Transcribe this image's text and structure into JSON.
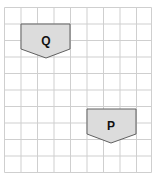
{
  "grid": {
    "x0": 4.5,
    "y0": 7.5,
    "cell": 16.5,
    "cols": 9,
    "rows": 10,
    "line_color": "#cfcfcf",
    "background": "#ffffff"
  },
  "shapes": [
    {
      "id": "Q",
      "label": "Q",
      "points": "21,24 70,24 70,49 46,58 21,49",
      "label_x": 46,
      "label_y": 45,
      "fill": "#dcdcdc",
      "stroke": "#606060"
    },
    {
      "id": "P",
      "label": "P",
      "points": "87,109 136,109 136,134 111,143 87,134",
      "label_x": 111,
      "label_y": 130,
      "fill": "#dcdcdc",
      "stroke": "#606060"
    }
  ]
}
